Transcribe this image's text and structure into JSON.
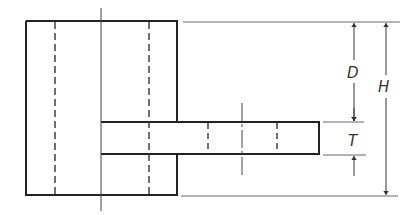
{
  "diagram": {
    "type": "engineering-drawing",
    "colors": {
      "outline": "#222222",
      "thin": "#555555",
      "background": "#ffffff"
    },
    "labels": {
      "D": "D",
      "T": "T",
      "H": "H"
    }
  }
}
